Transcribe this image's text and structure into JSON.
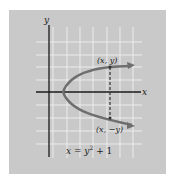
{
  "figure": {
    "background": "#c9c9c9",
    "grid_color": "#ececec",
    "axis_color": "#1a1a1a",
    "curve_color": "#6e6e6e",
    "axis_labels": {
      "x": "x",
      "y": "y"
    },
    "points": {
      "upper": "(x, y)",
      "lower": "(x, −y)"
    },
    "equation": {
      "base": "x = y",
      "exponent": "2",
      "tail": " + 1"
    }
  }
}
